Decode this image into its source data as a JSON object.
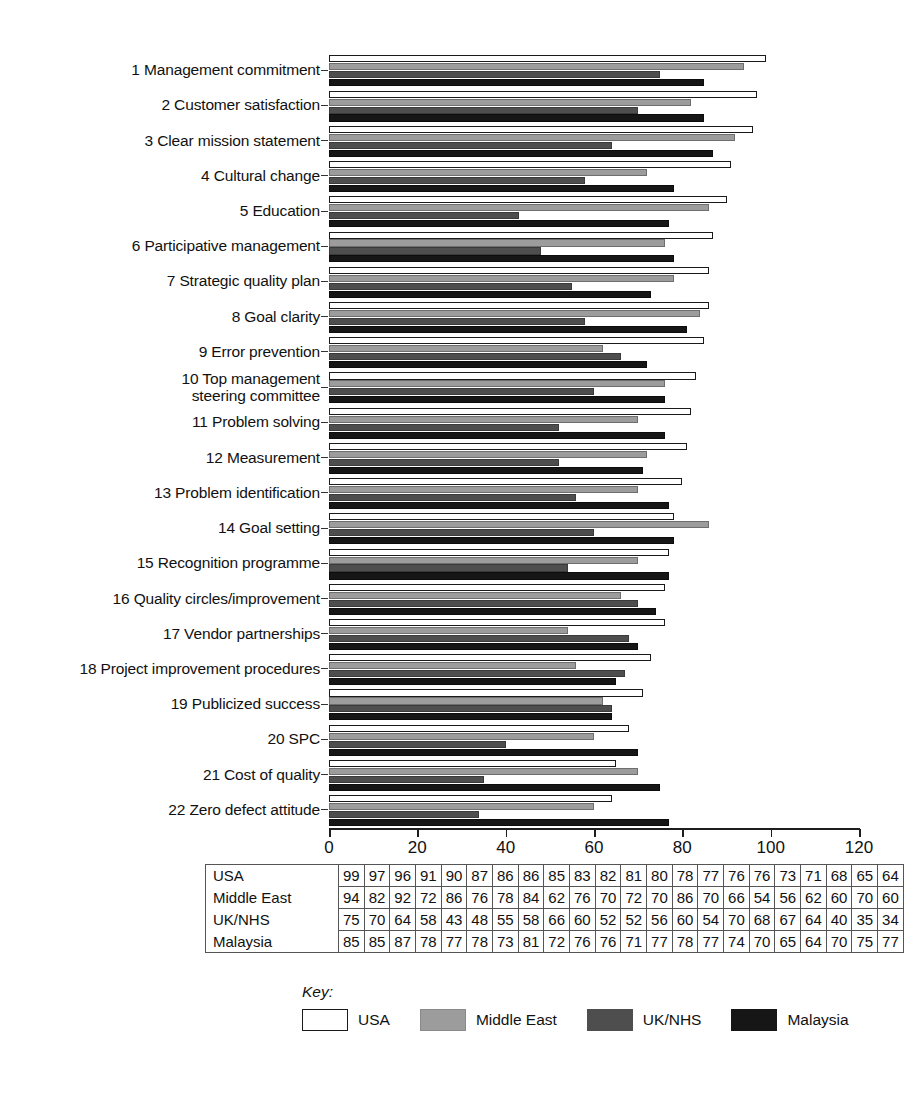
{
  "chart_data": {
    "type": "bar",
    "orientation": "horizontal",
    "title": "",
    "xlabel": "",
    "ylabel": "",
    "xlim": [
      0,
      120
    ],
    "xticks": [
      0,
      20,
      40,
      60,
      80,
      100,
      120
    ],
    "grid": false,
    "legend_position": "bottom",
    "categories": [
      "1 Management commitment",
      "2 Customer satisfaction",
      "3 Clear mission statement",
      "4 Cultural change",
      "5 Education",
      "6 Participative management",
      "7 Strategic quality plan",
      "8 Goal clarity",
      "9 Error prevention",
      "10 Top management\nsteering committee",
      "11 Problem solving",
      "12 Measurement",
      "13 Problem identification",
      "14 Goal setting",
      "15 Recognition programme",
      "16 Quality circles/improvement",
      "17 Vendor partnerships",
      "18 Project improvement procedures",
      "19 Publicized success",
      "20 SPC",
      "21 Cost of quality",
      "22 Zero defect attitude"
    ],
    "series": [
      {
        "name": "USA",
        "color": "#ffffff",
        "values": [
          99,
          97,
          96,
          91,
          90,
          87,
          86,
          86,
          85,
          83,
          82,
          81,
          80,
          78,
          77,
          76,
          76,
          73,
          71,
          68,
          65,
          64
        ]
      },
      {
        "name": "Middle East",
        "color": "#9c9c9c",
        "values": [
          94,
          82,
          92,
          72,
          86,
          76,
          78,
          84,
          62,
          76,
          70,
          72,
          70,
          86,
          70,
          66,
          54,
          56,
          62,
          60,
          70,
          60
        ]
      },
      {
        "name": "UK/NHS",
        "color": "#4e4e4e",
        "values": [
          75,
          70,
          64,
          58,
          43,
          48,
          55,
          58,
          66,
          60,
          52,
          52,
          56,
          60,
          54,
          70,
          68,
          67,
          64,
          40,
          35,
          34
        ]
      },
      {
        "name": "Malaysia",
        "color": "#161616",
        "values": [
          85,
          85,
          87,
          78,
          77,
          78,
          73,
          81,
          72,
          76,
          76,
          71,
          77,
          78,
          77,
          74,
          70,
          65,
          64,
          70,
          75,
          77
        ]
      }
    ]
  },
  "table": {
    "row_headers": [
      "USA",
      "Middle East",
      "UK/NHS",
      "Malaysia"
    ],
    "rows": [
      [
        99,
        97,
        96,
        91,
        90,
        87,
        86,
        86,
        85,
        83,
        82,
        81,
        80,
        78,
        77,
        76,
        76,
        73,
        71,
        68,
        65,
        64
      ],
      [
        94,
        82,
        92,
        72,
        86,
        76,
        78,
        84,
        62,
        76,
        70,
        72,
        70,
        86,
        70,
        66,
        54,
        56,
        62,
        60,
        70,
        60
      ],
      [
        75,
        70,
        64,
        58,
        43,
        48,
        55,
        58,
        66,
        60,
        52,
        52,
        56,
        60,
        54,
        70,
        68,
        67,
        64,
        40,
        35,
        34
      ],
      [
        85,
        85,
        87,
        78,
        77,
        78,
        73,
        81,
        72,
        76,
        76,
        71,
        77,
        78,
        77,
        74,
        70,
        65,
        64,
        70,
        75,
        77
      ]
    ]
  },
  "key": {
    "title": "Key:",
    "items": [
      {
        "label": "USA",
        "color": "#ffffff"
      },
      {
        "label": "Middle East",
        "color": "#9c9c9c"
      },
      {
        "label": "UK/NHS",
        "color": "#4e4e4e"
      },
      {
        "label": "Malaysia",
        "color": "#161616"
      }
    ]
  }
}
